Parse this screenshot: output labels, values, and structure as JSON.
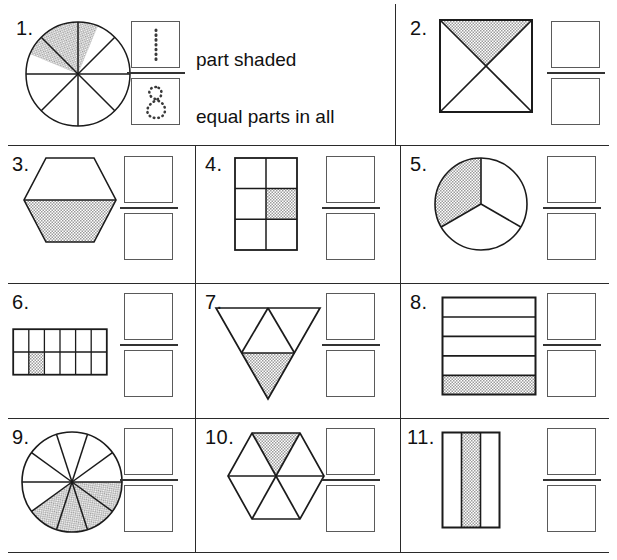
{
  "worksheet": {
    "title": "Fraction part-shaded worksheet",
    "shade_color": "#b9b9b9",
    "line_color": "#2a2a2a",
    "box_color": "#5a5a5a",
    "legend": {
      "numerator_text": "part shaded",
      "denominator_text": "equal parts in all",
      "numerator_value": "1",
      "denominator_value": "8"
    },
    "problems": [
      {
        "id": 1,
        "label": "1.",
        "figure": "circle-8-sectors",
        "total_parts": 8,
        "shaded_parts": 1,
        "is_example": true,
        "answer_numerator": "1",
        "answer_denominator": "8"
      },
      {
        "id": 2,
        "label": "2.",
        "figure": "square-4-triangles",
        "total_parts": 4,
        "shaded_parts": 1,
        "is_example": false,
        "answer_numerator": "",
        "answer_denominator": ""
      },
      {
        "id": 3,
        "label": "3.",
        "figure": "hexagon-2-halves",
        "total_parts": 2,
        "shaded_parts": 1,
        "is_example": false,
        "answer_numerator": "",
        "answer_denominator": ""
      },
      {
        "id": 4,
        "label": "4.",
        "figure": "rect-grid-2x3",
        "total_parts": 6,
        "shaded_parts": 1,
        "is_example": false,
        "answer_numerator": "",
        "answer_denominator": ""
      },
      {
        "id": 5,
        "label": "5.",
        "figure": "circle-3-sectors",
        "total_parts": 3,
        "shaded_parts": 1,
        "is_example": false,
        "answer_numerator": "",
        "answer_denominator": ""
      },
      {
        "id": 6,
        "label": "6.",
        "figure": "rect-grid-2x6",
        "total_parts": 12,
        "shaded_parts": 1,
        "is_example": false,
        "answer_numerator": "",
        "answer_denominator": ""
      },
      {
        "id": 7,
        "label": "7.",
        "figure": "triangle-4-parts",
        "total_parts": 4,
        "shaded_parts": 1,
        "is_example": false,
        "answer_numerator": "",
        "answer_denominator": ""
      },
      {
        "id": 8,
        "label": "8.",
        "figure": "rect-5-horizontal-strips",
        "total_parts": 5,
        "shaded_parts": 1,
        "is_example": false,
        "answer_numerator": "",
        "answer_denominator": ""
      },
      {
        "id": 9,
        "label": "9.",
        "figure": "circle-10-sectors",
        "total_parts": 10,
        "shaded_parts": 1,
        "is_example": false,
        "answer_numerator": "",
        "answer_denominator": ""
      },
      {
        "id": 10,
        "label": "10.",
        "figure": "hexagon-6-triangles",
        "total_parts": 6,
        "shaded_parts": 1,
        "is_example": false,
        "answer_numerator": "",
        "answer_denominator": ""
      },
      {
        "id": 11,
        "label": "11.",
        "figure": "rect-3-vertical-strips",
        "total_parts": 3,
        "shaded_parts": 1,
        "is_example": false,
        "answer_numerator": "",
        "answer_denominator": ""
      }
    ]
  }
}
